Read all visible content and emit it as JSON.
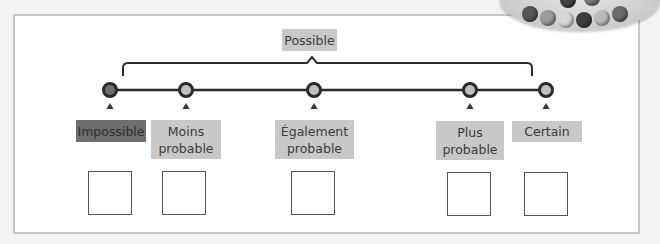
{
  "diagram": {
    "title_label": "Possible",
    "scale": [
      {
        "id": "impossible",
        "label": "Impossible",
        "x": 110,
        "node_fill": "#6e6e6e",
        "tag": {
          "x": 76,
          "y": 120,
          "w": 70,
          "h": 22,
          "dark": true
        },
        "box_x": 88
      },
      {
        "id": "moins-probable",
        "label": "Moins probable",
        "x": 186,
        "node_fill": "#c0c0c0",
        "tag": {
          "x": 151,
          "y": 120,
          "w": 70,
          "h": 39,
          "dark": false
        },
        "box_x": 162
      },
      {
        "id": "egalement-probable",
        "label": "Également probable",
        "x": 314,
        "node_fill": "#c0c0c0",
        "tag": {
          "x": 275,
          "y": 120,
          "w": 79,
          "h": 39,
          "dark": false
        },
        "box_x": 291
      },
      {
        "id": "plus-probable",
        "label": "Plus probable",
        "x": 470,
        "node_fill": "#c0c0c0",
        "tag": {
          "x": 436,
          "y": 121,
          "w": 68,
          "h": 39,
          "dark": false
        },
        "box_x": 447
      },
      {
        "id": "certain",
        "label": "Certain",
        "x": 546,
        "node_fill": "#c0c0c0",
        "tag": {
          "x": 512,
          "y": 121,
          "w": 70,
          "h": 21,
          "dark": false
        },
        "box_x": 524
      }
    ],
    "colors": {
      "line": "#2b2b2b",
      "tag_light": "#c8c8c8",
      "tag_dark": "#6e6e6e",
      "frame_border": "#c6c6c6"
    }
  }
}
